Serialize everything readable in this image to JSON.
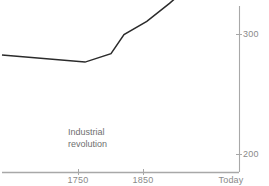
{
  "chart_data": {
    "type": "line",
    "title": "",
    "subtitle": "",
    "xlabel": "",
    "ylabel": "CO2 (ppm)",
    "ylabel_name": "CO",
    "ylabel_sub": "2",
    "ylabel_unit": "(ppm)",
    "grid": false,
    "legend": "none",
    "xlim_labels": [
      "1750",
      "1850",
      "Today"
    ],
    "ylim": [
      160,
      420
    ],
    "yticks": [
      200,
      300
    ],
    "ytick_labels": [
      "200",
      "300"
    ],
    "xticks": [
      "1750",
      "1850",
      "Today"
    ],
    "annotations": [
      {
        "text_line1": "Industrial",
        "text_line2": "revolution",
        "x": 1755,
        "y": 240
      }
    ],
    "series": [
      {
        "name": "Atmospheric CO2 concentration",
        "color": "#2b2b2b",
        "points": [
          {
            "x": 1000,
            "y": 283
          },
          {
            "x": 1760,
            "y": 277
          },
          {
            "x": 1800,
            "y": 284
          },
          {
            "x": 1820,
            "y": 300
          },
          {
            "x": 1855,
            "y": 311
          },
          {
            "x": 1890,
            "y": 326
          },
          {
            "x": 1920,
            "y": 340
          },
          {
            "x": 1945,
            "y": 341
          },
          {
            "x": 1975,
            "y": 363
          },
          {
            "x": 1995,
            "y": 372
          },
          {
            "x": 2000,
            "y": 366
          },
          {
            "x": 2022,
            "y": 418
          }
        ]
      }
    ]
  },
  "axis": {
    "ytick_200": "200",
    "ytick_300": "300",
    "xtick_1750": "1750",
    "xtick_1850": "1850",
    "xtick_today": "Today"
  },
  "annotation": {
    "line1": "Industrial",
    "line2": "revolution"
  },
  "ylabel": {
    "name": "CO",
    "sub": "2",
    "unit": "(ppm)"
  },
  "colors": {
    "line": "#2b2b2b",
    "axis": "#a8a8a8",
    "tick_text": "#8a8a8a",
    "annotation_text": "#6f6f6f",
    "background": "#ffffff"
  }
}
